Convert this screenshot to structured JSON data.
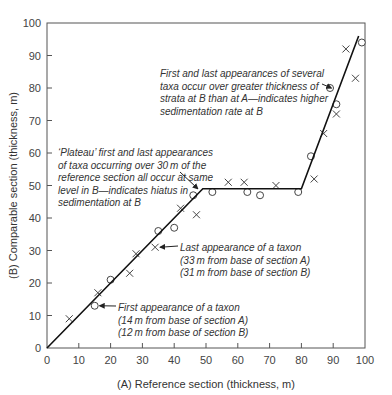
{
  "chart_data": {
    "type": "scatter",
    "title": "",
    "xlabel": "(A) Reference section (thickness, m)",
    "ylabel": "(B) Comparable section (thickness, m)",
    "xlim": [
      0,
      100
    ],
    "ylim": [
      0,
      100
    ],
    "x_ticks": [
      0,
      10,
      20,
      30,
      40,
      50,
      60,
      70,
      80,
      90,
      100
    ],
    "y_ticks": [
      0,
      10,
      20,
      30,
      40,
      50,
      60,
      70,
      80,
      90,
      100
    ],
    "grid": false,
    "legend": null,
    "series": [
      {
        "name": "Last appearances (×)",
        "marker": "x",
        "points": [
          [
            7,
            9
          ],
          [
            16,
            17
          ],
          [
            26,
            23
          ],
          [
            28,
            29
          ],
          [
            34,
            31
          ],
          [
            42,
            43
          ],
          [
            47,
            41
          ],
          [
            57,
            51
          ],
          [
            62,
            51
          ],
          [
            72,
            50
          ],
          [
            84,
            52
          ],
          [
            87,
            66
          ],
          [
            91,
            72
          ],
          [
            94,
            92
          ],
          [
            97,
            83
          ]
        ]
      },
      {
        "name": "First appearances (○)",
        "marker": "o",
        "points": [
          [
            15,
            13
          ],
          [
            20,
            21
          ],
          [
            35,
            36
          ],
          [
            40,
            37
          ],
          [
            46,
            47
          ],
          [
            52,
            48
          ],
          [
            63,
            48
          ],
          [
            67,
            47
          ],
          [
            79,
            48
          ],
          [
            83,
            59
          ],
          [
            89,
            80
          ],
          [
            91,
            75
          ],
          [
            99,
            94
          ]
        ]
      },
      {
        "name": "Line of correlation",
        "type": "line",
        "points": [
          [
            0,
            0
          ],
          [
            49,
            49
          ],
          [
            80,
            49
          ],
          [
            98,
            96
          ]
        ]
      }
    ],
    "annotations": [
      {
        "id": "sedimentation",
        "lines": [
          "First and last appearances of several",
          "taxa occur over greater thickness of",
          "strata at B than at A—indicates higher",
          "sedimentation rate at B"
        ],
        "arrow_to": [
          91,
          80
        ]
      },
      {
        "id": "plateau",
        "lines": [
          "‘Plateau’ first and last appearances",
          "of taxa occurring over 30 m of the",
          "reference section all occur at same",
          "level in B—indicates hiatus in",
          "sedimentation at B"
        ],
        "arrow_to": [
          49,
          49
        ]
      },
      {
        "id": "last-appearance",
        "lines": [
          "Last appearance of a taxon",
          "(33 m from base of section A)",
          "(31 m from base of section B)"
        ],
        "arrow_to": [
          34,
          31
        ]
      },
      {
        "id": "first-appearance",
        "lines": [
          "First appearance of a taxon",
          "(14 m from base of section A)",
          "(12 m from base of section B)"
        ],
        "arrow_to": [
          15,
          13
        ]
      }
    ]
  },
  "colors": {
    "axis": "#555555",
    "line": "#111111",
    "marker": "#444444",
    "text": "#333333"
  }
}
